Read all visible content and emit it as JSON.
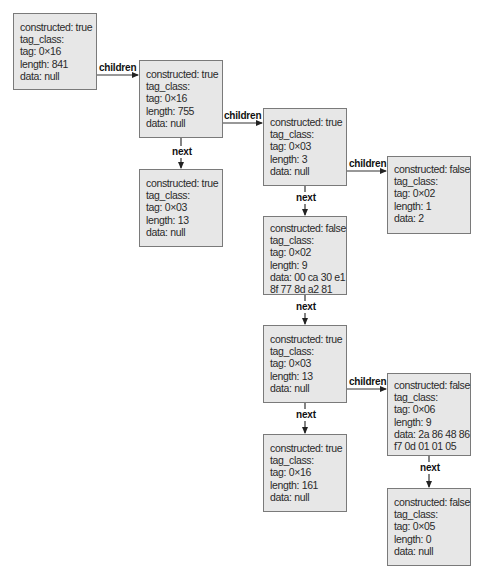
{
  "diagram": {
    "nodes": [
      {
        "id": "n1",
        "lines": [
          "constructed: true",
          "tag_class:",
          "tag: 0×16",
          "length: 841",
          "data: null"
        ]
      },
      {
        "id": "n2",
        "lines": [
          "constructed: true",
          "tag_class:",
          "tag: 0×16",
          "length: 755",
          "data: null"
        ]
      },
      {
        "id": "n3",
        "lines": [
          "constructed: true",
          "tag_class:",
          "tag: 0×03",
          "length: 13",
          "data: null"
        ]
      },
      {
        "id": "n4",
        "lines": [
          "constructed: true",
          "tag_class:",
          "tag: 0×03",
          "length: 3",
          "data: null"
        ]
      },
      {
        "id": "n5",
        "lines": [
          "constructed: false",
          "tag_class:",
          "tag: 0×02",
          "length: 1",
          "data: 2"
        ]
      },
      {
        "id": "n6",
        "lines": [
          "constructed: false",
          "tag_class:",
          "tag: 0×02",
          "length: 9",
          "data: 00 ca 30 e1",
          "8f 77 8d a2 81"
        ]
      },
      {
        "id": "n7",
        "lines": [
          "constructed: true",
          "tag_class:",
          "tag: 0×03",
          "length: 13",
          "data: null"
        ]
      },
      {
        "id": "n8",
        "lines": [
          "constructed: false",
          "tag_class:",
          "tag: 0×06",
          "length: 9",
          "data: 2a 86 48 86",
          "f7 0d 01 01 05"
        ]
      },
      {
        "id": "n9",
        "lines": [
          "constructed: true",
          "tag_class:",
          "tag: 0×16",
          "length: 161",
          "data: null"
        ]
      },
      {
        "id": "n10",
        "lines": [
          "constructed: false",
          "tag_class:",
          "tag: 0×05",
          "length: 0",
          "data: null"
        ]
      }
    ],
    "edges": [
      {
        "from": "n1",
        "to": "n2",
        "label": "children"
      },
      {
        "from": "n2",
        "to": "n4",
        "label": "children"
      },
      {
        "from": "n2",
        "to": "n3",
        "label": "next"
      },
      {
        "from": "n4",
        "to": "n5",
        "label": "children"
      },
      {
        "from": "n4",
        "to": "n6",
        "label": "next"
      },
      {
        "from": "n6",
        "to": "n7",
        "label": "next"
      },
      {
        "from": "n7",
        "to": "n8",
        "label": "children"
      },
      {
        "from": "n7",
        "to": "n9",
        "label": "next"
      },
      {
        "from": "n8",
        "to": "n10",
        "label": "next"
      }
    ]
  }
}
